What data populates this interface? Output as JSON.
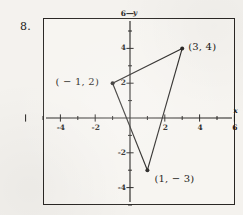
{
  "problem": {
    "number": "8."
  },
  "chart_data": {
    "type": "scatter",
    "title": "",
    "subtitle": "",
    "xlabel": "x",
    "ylabel": "y",
    "grid": false,
    "legend": null,
    "xlim": [
      -6,
      6
    ],
    "ylim": [
      -6,
      6
    ],
    "x_ticks": [
      -6,
      -5,
      -4,
      -3,
      -2,
      -1,
      1,
      2,
      3,
      4,
      5,
      6
    ],
    "y_ticks": [
      -5,
      -4,
      -3,
      -2,
      -1,
      1,
      2,
      3,
      4,
      5,
      6
    ],
    "x_tick_labels": [
      {
        "value": -4,
        "text": "-4"
      },
      {
        "value": -2,
        "text": "-2"
      },
      {
        "value": 2,
        "text": "2"
      },
      {
        "value": 4,
        "text": "4"
      },
      {
        "value": 6,
        "text": "6"
      }
    ],
    "y_tick_labels": [
      {
        "value": 6,
        "text": "6"
      },
      {
        "value": 4,
        "text": "4"
      },
      {
        "value": 2,
        "text": "2"
      },
      {
        "value": -2,
        "text": "-2"
      },
      {
        "value": -4,
        "text": "-4"
      }
    ],
    "shape": "triangle",
    "points": [
      {
        "name": "vertex-a",
        "x": -1,
        "y": 2,
        "label": "( − 1, 2)",
        "label_position": "left"
      },
      {
        "name": "vertex-b",
        "x": 3,
        "y": 4,
        "label": "(3, 4)",
        "label_position": "right"
      },
      {
        "name": "vertex-c",
        "x": 1,
        "y": -3,
        "label": "(1, − 3)",
        "label_position": "below-right"
      }
    ],
    "edges": [
      {
        "from": "vertex-a",
        "to": "vertex-b"
      },
      {
        "from": "vertex-b",
        "to": "vertex-c"
      },
      {
        "from": "vertex-c",
        "to": "vertex-a"
      }
    ]
  },
  "colors": {
    "ink": "#1d1b19",
    "paper": "#f4f2ee",
    "plot_background": "#f7f5f1",
    "border": "#2a2724"
  }
}
